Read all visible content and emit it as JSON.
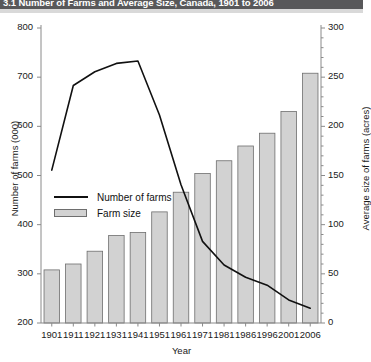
{
  "header": {
    "title": "3.1 Number of Farms and Average Size, Canada, 1901 to 2006",
    "bar_color": "#58585a"
  },
  "axes": {
    "left": {
      "label": "Number of farms (000)",
      "ticks": [
        "800",
        "700",
        "600",
        "500",
        "400",
        "300",
        "200"
      ],
      "min": 200,
      "max": 800
    },
    "right": {
      "label": "Average size of farms (acres)",
      "ticks": [
        "300",
        "250",
        "200",
        "150",
        "100",
        "50",
        "0"
      ],
      "min": 0,
      "max": 300
    },
    "x": {
      "label": "Year"
    }
  },
  "legend": {
    "items": [
      {
        "label": "Number of farms",
        "marker": "line",
        "color": "#111111"
      },
      {
        "label": "Farm size",
        "marker": "bar",
        "color": "#d2d2d2"
      }
    ]
  },
  "chart_data": {
    "type": "bar",
    "title": "3.1 Number of Farms and Average Size, Canada, 1901 to 2006",
    "xlabel": "Year",
    "ylabel": "Number of farms (000)",
    "y2label": "Average size of farms (acres)",
    "categories": [
      "1901",
      "1911",
      "1921",
      "1931",
      "1941",
      "1951",
      "1961",
      "1971",
      "1981",
      "1986",
      "1996",
      "2001",
      "2006"
    ],
    "ylim": [
      200,
      800
    ],
    "y2lim": [
      0,
      300
    ],
    "grid": false,
    "legend_position": "inside-left",
    "series": [
      {
        "name": "Farm size",
        "type": "bar",
        "axis": "right",
        "unit": "acres",
        "color": "#d2d2d2",
        "edge_color": "#6e6e6e",
        "values": [
          54,
          60,
          73,
          89,
          92,
          113,
          133,
          152,
          165,
          180,
          193,
          215,
          254
        ]
      },
      {
        "name": "Number of farms",
        "type": "line",
        "axis": "left",
        "unit": "thousands",
        "color": "#111111",
        "values": [
          511,
          683,
          711,
          728,
          733,
          623,
          481,
          366,
          318,
          293,
          277,
          247,
          230
        ]
      }
    ]
  }
}
